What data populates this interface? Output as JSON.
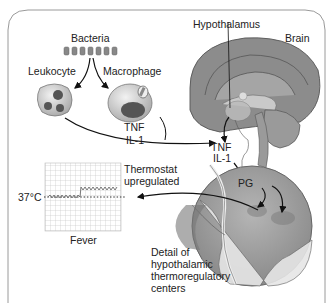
{
  "diagram": {
    "labels": {
      "bacteria": "Bacteria",
      "leukocyte": "Leukocyte",
      "macrophage": "Macrophage",
      "tnf_1": "TNF",
      "il1_1": "IL-1",
      "hypothalamus": "Hypothalamus",
      "brain": "Brain",
      "tnf_2": "TNF",
      "il1_2": "IL-1",
      "pg": "PG",
      "thermostat_line1": "Thermostat",
      "thermostat_line2": "upregulated",
      "temp": "37°C",
      "fever": "Fever",
      "detail_line1": "Detail of",
      "detail_line2": "hypothalamic",
      "detail_line3": "thermoregulatory",
      "detail_line4": "centers"
    },
    "colors": {
      "frame": "#9a9a9a",
      "brain_fill": "#8c8c8c",
      "cell_fill": "#c8c8c8",
      "nucleus": "#555555",
      "grid": "#bdbdbd",
      "arrow": "#111111"
    }
  }
}
